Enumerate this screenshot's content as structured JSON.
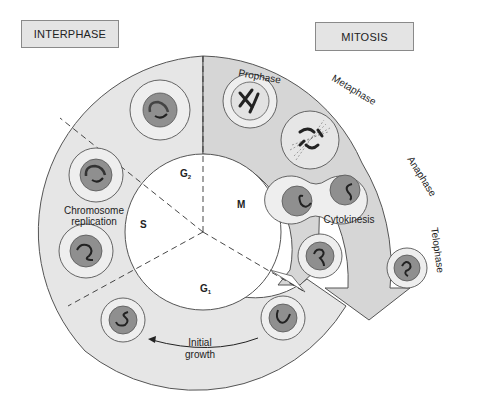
{
  "headers": {
    "interphase": "INTERPHASE",
    "mitosis": "MITOSIS"
  },
  "phases": {
    "g1": {
      "letter": "G",
      "sub": "1"
    },
    "g2": {
      "letter": "G",
      "sub": "2"
    },
    "s": "S",
    "m": "M"
  },
  "mitosis_stages": [
    "Prophase",
    "Metaphase",
    "Anaphase",
    "Telophase"
  ],
  "labels": {
    "chromosome_replication_line1": "Chromosome",
    "chromosome_replication_line2": "replication",
    "cytokinesis": "Cytokinesis",
    "initial_growth_line1": "Initial",
    "initial_growth_line2": "growth"
  },
  "colors": {
    "ring_fill": "#e6e6e6",
    "mitosis_fill": "#d4d4d4",
    "cell_fill": "#eeeeee",
    "nucleus_fill": "#8f8f8f",
    "chromosome": "#2a2a2a",
    "outline": "#555555"
  }
}
